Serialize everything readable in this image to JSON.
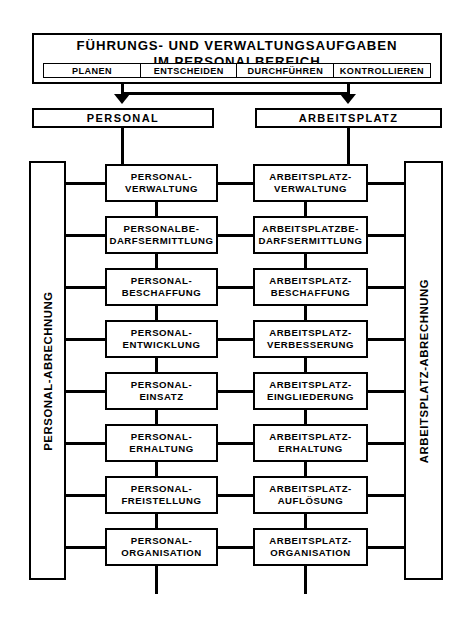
{
  "diagram": {
    "title_line1": "FÜHRUNGS- UND VERWALTUNGSAUFGABEN",
    "title_line2": "IM PERSONALBEREICH",
    "title_full": "FÜHRUNGS- UND VERWALTUNGSAUFGABEN\nIM PERSONALBEREICH",
    "phases": [
      {
        "label": "PLANEN"
      },
      {
        "label": "ENTSCHEIDEN"
      },
      {
        "label": "DURCHFÜHREN"
      },
      {
        "label": "KONTROLLIEREN"
      }
    ],
    "columns": [
      {
        "heading": "PERSONAL",
        "sidebar": "PERSONAL-ABRECHNUNG"
      },
      {
        "heading": "ARBEITSPLATZ",
        "sidebar": "ARBEITSPLATZ-ABRECHNUNG"
      }
    ],
    "rows": [
      {
        "left": "PERSONAL-\nVERWALTUNG",
        "right": "ARBEITSPLATZ-\nVERWALTUNG"
      },
      {
        "left": "PERSONALBE-\nDARFSERMITTLUNG",
        "right": "ARBEITSPLATZBE-\nDARFSERMITTLUNG"
      },
      {
        "left": "PERSONAL-\nBESCHAFFUNG",
        "right": "ARBEITSPLATZ-\nBESCHAFFUNG"
      },
      {
        "left": "PERSONAL-\nENTWICKLUNG",
        "right": "ARBEITSPLATZ-\nVERBESSERUNG"
      },
      {
        "left": "PERSONAL-\nEINSATZ",
        "right": "ARBEITSPLATZ-\nEINGLIEDERUNG"
      },
      {
        "left": "PERSONAL-\nERHALTUNG",
        "right": "ARBEITSPLATZ-\nERHALTUNG"
      },
      {
        "left": "PERSONAL-\nFREISTELLUNG",
        "right": "ARBEITSPLATZ-\nAUFLÖSUNG"
      },
      {
        "left": "PERSONAL-\nORGANISATION",
        "right": "ARBEITSPLATZ-\nORGANISATION"
      }
    ],
    "colors": {
      "ink": "#000000",
      "paper": "#ffffff"
    }
  }
}
